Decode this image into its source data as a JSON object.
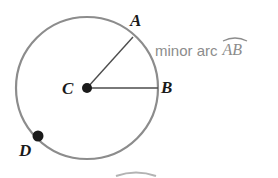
{
  "figure": {
    "type": "circle-diagram",
    "background_color": "#ffffff",
    "stroke_color": "#8c8c8c",
    "radius_line_color": "#4d4d4d",
    "point_color": "#1a1a1a",
    "label_color": "#1a1a1a",
    "annotation_color": "#8c8c8c",
    "circle": {
      "center_label": "C",
      "center_x": 87,
      "center_y": 88,
      "radius": 71
    },
    "points": [
      {
        "label": "A",
        "x": 133,
        "y": 37,
        "marked": false
      },
      {
        "label": "B",
        "x": 158,
        "y": 88,
        "marked": false
      },
      {
        "label": "C",
        "x": 87,
        "y": 88,
        "marked": true
      },
      {
        "label": "D",
        "x": 38,
        "y": 136,
        "marked": true
      }
    ],
    "radii": [
      {
        "from": "C",
        "to": "A"
      },
      {
        "from": "C",
        "to": "B"
      }
    ]
  },
  "labels": {
    "a": "A",
    "b": "B",
    "c": "C",
    "d": "D"
  },
  "annotation": {
    "text": "minor arc",
    "arc_name": "AB",
    "has_arc_symbol": true
  },
  "cropped_bottom": {
    "has_partial_arc_symbol": true
  }
}
